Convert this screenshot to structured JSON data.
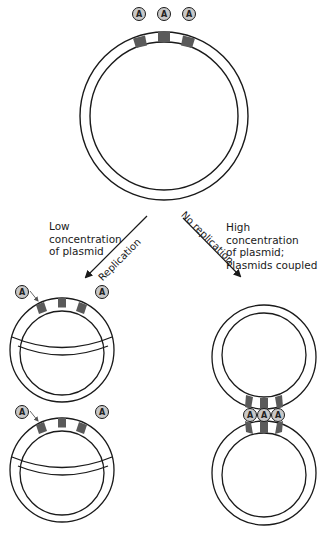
{
  "colors": {
    "stroke": "#1a1a1a",
    "band_dark": "#5a5a5a",
    "circle_fill": "#ffffff",
    "protein_fill": "#c8c8c8"
  },
  "protein_label": "A",
  "labels": {
    "low_concentration": "Low\nconcentration\nof plasmid",
    "high_concentration": "High concentration\nof plasmid;\nPlasmids coupled"
  },
  "arrows": {
    "replication": "Replication",
    "no_replication": "No replication"
  },
  "plasmids": [
    {
      "id": "initial",
      "description": "single plasmid with three A-binding sites, three free A proteins above"
    },
    {
      "id": "replicated-1",
      "description": "replicating plasmid (theta structure), one A binding"
    },
    {
      "id": "replicated-2",
      "description": "replicating plasmid (theta structure), one A binding"
    },
    {
      "id": "coupled-top",
      "description": "plasmid coupled via three A proteins"
    },
    {
      "id": "coupled-bottom",
      "description": "plasmid coupled via three A proteins"
    }
  ]
}
